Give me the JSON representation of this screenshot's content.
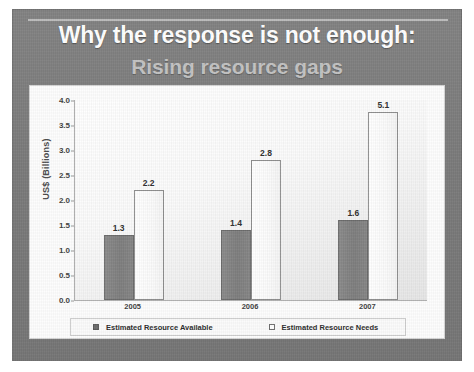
{
  "slide": {
    "title": "Why the response is not enough:",
    "subtitle": "Rising resource gaps"
  },
  "chart_data": {
    "type": "bar",
    "title": "",
    "xlabel": "",
    "ylabel": "US$ (Billions)",
    "ylim": [
      0.0,
      4.0
    ],
    "ytick_labels": [
      "4.0",
      "3.5",
      "3.0",
      "2.5",
      "2.0",
      "1.5",
      "1.0",
      "0.5",
      "0.0"
    ],
    "ytick_values": [
      4.0,
      3.5,
      3.0,
      2.5,
      2.0,
      1.5,
      1.0,
      0.5,
      0.0
    ],
    "grid": false,
    "legend_position": "bottom",
    "categories": [
      "2005",
      "2006",
      "2007"
    ],
    "series": [
      {
        "name": "Estimated Resource Available",
        "style": "filled",
        "values": [
          1.3,
          1.4,
          1.6
        ],
        "labels": [
          "1.3",
          "1.4",
          "1.6"
        ]
      },
      {
        "name": "Estimated Resource Needs",
        "style": "hollow",
        "values": [
          2.2,
          2.8,
          5.1
        ],
        "labels": [
          "2.2",
          "2.8",
          "5.1"
        ]
      }
    ]
  }
}
